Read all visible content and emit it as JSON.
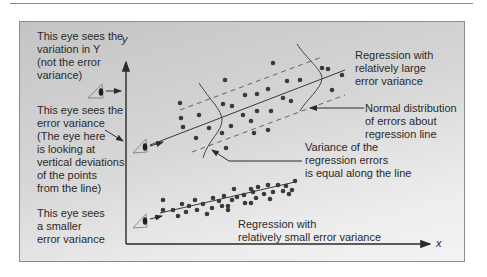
{
  "labels": {
    "eye_top": "This eye sees the\nvariation in Y\n(not the error\nvariance)",
    "eye_middle": "This eye sees the\nerror variance\n(The eye here\nis looking at\nvertical deviations\nof the points\nfrom the line)",
    "eye_bottom": "This eye sees\na smaller\nerror variance",
    "large_regression": "Regression with\nrelatively large\nerror variance",
    "normal_dist": "Normal distribution\nof errors about\nregression line",
    "variance_equal": "Variance of the\nregression errors\nis equal along the line",
    "small_regression": "Regression with\nrelatively small error variance"
  },
  "axes": {
    "x_label": "x",
    "y_label": "y"
  },
  "colors": {
    "ink": "#2a2a2a",
    "dot": "#3a3a3a",
    "panel_top": "#c4c4c4",
    "panel_bottom": "#f3f3f3"
  },
  "icons": [
    "eye-icon-top",
    "eye-icon-middle",
    "eye-icon-bottom"
  ]
}
